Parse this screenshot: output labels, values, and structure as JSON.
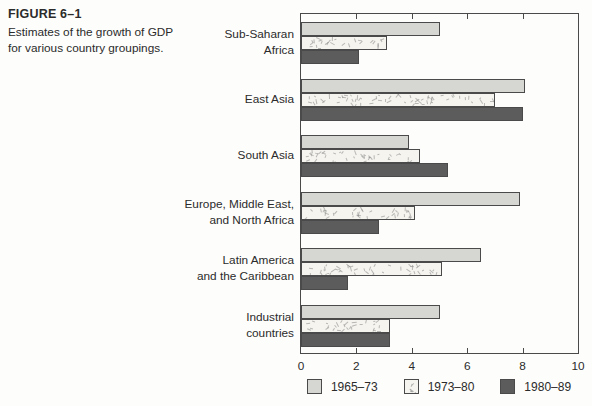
{
  "figure": {
    "label": "FIGURE 6–1",
    "caption_line1": "Estimates of the growth of GDP",
    "caption_line2": "for various country groupings."
  },
  "chart_data": {
    "type": "bar",
    "orientation": "horizontal",
    "title": "Estimates of the growth of GDP for various country groupings",
    "xlabel": "",
    "ylabel": "",
    "xlim": [
      0,
      10
    ],
    "xticks": [
      0,
      2,
      4,
      6,
      8,
      10
    ],
    "grid": false,
    "legend_position": "bottom",
    "categories": [
      "Sub-Saharan Africa",
      "East Asia",
      "South Asia",
      "Europe, Middle East, and North Africa",
      "Latin America and the Caribbean",
      "Industrial countries"
    ],
    "category_display": [
      [
        "Sub-Saharan",
        "Africa"
      ],
      [
        "East Asia"
      ],
      [
        "South Asia"
      ],
      [
        "Europe, Middle East,",
        "and North Africa"
      ],
      [
        "Latin America",
        "and the Caribbean"
      ],
      [
        "Industrial",
        "countries"
      ]
    ],
    "series": [
      {
        "name": "1965–73",
        "style": "light",
        "values": [
          5.0,
          8.1,
          3.9,
          7.9,
          6.5,
          5.0
        ]
      },
      {
        "name": "1973–80",
        "style": "speckled",
        "values": [
          3.1,
          7.0,
          4.3,
          4.1,
          5.1,
          3.2
        ]
      },
      {
        "name": "1980–89",
        "style": "dark",
        "values": [
          2.1,
          8.0,
          5.3,
          2.8,
          1.7,
          3.2
        ]
      }
    ],
    "colors": {
      "light": "#d6d6d3",
      "speckled": "#f5f4ef",
      "dark": "#5c5c5c",
      "bar_border": "#4a4a4a",
      "axis": "#4a4a4a",
      "text": "#2b2b2b",
      "background": "#fdfdfb"
    }
  }
}
